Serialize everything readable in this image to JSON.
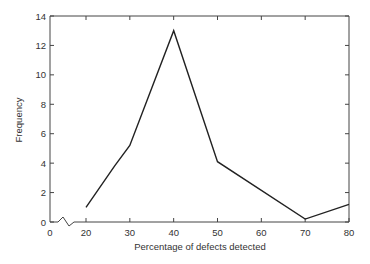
{
  "chart_data": {
    "type": "line",
    "title": "",
    "xlabel": "Percentage of defects detected",
    "ylabel": "Frequency",
    "xlim": [
      0,
      80
    ],
    "ylim": [
      0,
      14
    ],
    "x_axis_break": true,
    "x_ticks": [
      0,
      20,
      30,
      40,
      50,
      60,
      70,
      80
    ],
    "y_ticks": [
      0,
      2,
      4,
      6,
      8,
      10,
      12,
      14
    ],
    "grid": false,
    "legend": null,
    "series": [
      {
        "name": "Frequency",
        "x": [
          20,
          26.5,
          30,
          40,
          50,
          70,
          80
        ],
        "values": [
          1,
          3.8,
          5.2,
          13,
          4.1,
          0.2,
          1.2
        ]
      }
    ]
  }
}
